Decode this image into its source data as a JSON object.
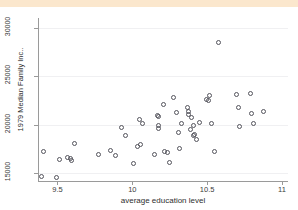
{
  "figure": {
    "top_band_text": "",
    "background_color": "#ffffff",
    "band_color": "#fbe7cd",
    "marker_color": "#54545c",
    "grid_color": "#f0f0f2",
    "axis_color": "#9a9a9a"
  },
  "chart_data": {
    "type": "scatter",
    "title": "",
    "xlabel": "average education level",
    "ylabel": "1979 Median Family Inc..",
    "xlim": [
      9.37,
      11.04
    ],
    "ylim": [
      14200,
      31000
    ],
    "xticks": [
      9.5,
      10,
      10.5,
      11
    ],
    "xticklabels": [
      "9.5",
      "10",
      "10.5",
      "11"
    ],
    "yticks": [
      15000,
      20000,
      25000,
      30000
    ],
    "yticklabels": [
      "15000",
      "20000",
      "25000",
      "30000"
    ],
    "grid": "horizontal",
    "legend": "none",
    "marker": "open-circle",
    "points": [
      {
        "x": 9.41,
        "y": 17200
      },
      {
        "x": 9.4,
        "y": 14650
      },
      {
        "x": 9.5,
        "y": 14550
      },
      {
        "x": 9.52,
        "y": 16350
      },
      {
        "x": 9.57,
        "y": 16600
      },
      {
        "x": 9.59,
        "y": 16450
      },
      {
        "x": 9.6,
        "y": 16300
      },
      {
        "x": 9.62,
        "y": 18050
      },
      {
        "x": 9.78,
        "y": 16900
      },
      {
        "x": 9.86,
        "y": 17300
      },
      {
        "x": 9.89,
        "y": 16750
      },
      {
        "x": 9.93,
        "y": 19700
      },
      {
        "x": 9.96,
        "y": 18850
      },
      {
        "x": 10.01,
        "y": 15950
      },
      {
        "x": 10.04,
        "y": 17750
      },
      {
        "x": 10.05,
        "y": 20500
      },
      {
        "x": 10.06,
        "y": 17900
      },
      {
        "x": 10.07,
        "y": 20050
      },
      {
        "x": 10.15,
        "y": 16900
      },
      {
        "x": 10.17,
        "y": 20850
      },
      {
        "x": 10.18,
        "y": 20800
      },
      {
        "x": 10.18,
        "y": 19900
      },
      {
        "x": 10.18,
        "y": 19550
      },
      {
        "x": 10.21,
        "y": 22050
      },
      {
        "x": 10.22,
        "y": 17200
      },
      {
        "x": 10.24,
        "y": 17050
      },
      {
        "x": 10.25,
        "y": 16100
      },
      {
        "x": 10.28,
        "y": 22800
      },
      {
        "x": 10.3,
        "y": 21250
      },
      {
        "x": 10.31,
        "y": 19150
      },
      {
        "x": 10.32,
        "y": 17450
      },
      {
        "x": 10.33,
        "y": 20100
      },
      {
        "x": 10.37,
        "y": 21700
      },
      {
        "x": 10.38,
        "y": 21350
      },
      {
        "x": 10.38,
        "y": 21050
      },
      {
        "x": 10.39,
        "y": 19450
      },
      {
        "x": 10.4,
        "y": 20700
      },
      {
        "x": 10.41,
        "y": 19850
      },
      {
        "x": 10.41,
        "y": 18800
      },
      {
        "x": 10.42,
        "y": 18950
      },
      {
        "x": 10.43,
        "y": 18450
      },
      {
        "x": 10.45,
        "y": 20200
      },
      {
        "x": 10.5,
        "y": 22500
      },
      {
        "x": 10.51,
        "y": 22400
      },
      {
        "x": 10.52,
        "y": 22950
      },
      {
        "x": 10.53,
        "y": 20100
      },
      {
        "x": 10.55,
        "y": 17200
      },
      {
        "x": 10.58,
        "y": 28400
      },
      {
        "x": 10.7,
        "y": 23100
      },
      {
        "x": 10.71,
        "y": 21750
      },
      {
        "x": 10.72,
        "y": 19800
      },
      {
        "x": 10.79,
        "y": 23150
      },
      {
        "x": 10.8,
        "y": 21150
      },
      {
        "x": 10.81,
        "y": 20100
      },
      {
        "x": 10.88,
        "y": 21300
      }
    ]
  }
}
